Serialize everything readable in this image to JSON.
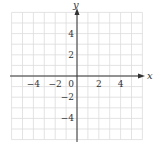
{
  "chart_data": {
    "type": "scatter",
    "title": "",
    "xlabel": "x",
    "ylabel": "y",
    "xlim": [
      -6,
      6
    ],
    "ylim": [
      -6,
      6
    ],
    "grid": true,
    "grid_step": 1,
    "x_ticks": [
      -4,
      -2,
      0,
      2,
      4
    ],
    "y_ticks": [
      4,
      2,
      -2,
      -4
    ],
    "x_tick_labels": [
      "−4",
      "−2",
      "0",
      "2",
      "4"
    ],
    "y_tick_labels": [
      "4",
      "2",
      "−2",
      "−4"
    ],
    "series": [],
    "legend": null
  },
  "colors": {
    "grid": "#dcdcdc",
    "axis": "#333333",
    "text": "#333333"
  }
}
